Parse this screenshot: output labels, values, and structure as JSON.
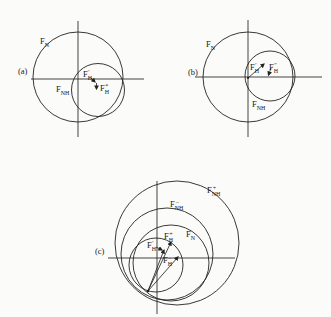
{
  "figure": {
    "background": "#fbfbfa",
    "ink": "#222222",
    "panels": [
      {
        "id": "a",
        "tag": "(a)",
        "tag_pos": {
          "x": 18,
          "y": 74
        },
        "axes": [
          {
            "name": "h-axis",
            "x1": 31,
            "y1": 79,
            "x2": 144,
            "y2": 79
          },
          {
            "name": "v-axis",
            "x1": 78,
            "y1": 21,
            "x2": 78,
            "y2": 137
          }
        ],
        "circles": [
          {
            "name": "circle-FN",
            "cx": 78,
            "cy": 77,
            "r": 45
          },
          {
            "name": "circle-FNH",
            "cx": 98,
            "cy": 90,
            "r": 26.5
          }
        ],
        "labels": [
          {
            "name": "label-FN",
            "t": "F",
            "sub": "N",
            "sup": "",
            "x": 40,
            "y": 44
          },
          {
            "name": "label-FNH",
            "t": "F",
            "sub": "NH",
            "sup": "",
            "x": 56,
            "y": 92
          },
          {
            "name": "label-FH-prime",
            "t": "F",
            "sub": "H",
            "sup": "′",
            "x": 83,
            "y": 77
          },
          {
            "name": "label-FH-star",
            "t": "F",
            "sub": "H",
            "sup": "*",
            "x": 100,
            "y": 91
          }
        ],
        "arrows": [
          {
            "name": "leader-FH-prime",
            "x1": 91,
            "y1": 78,
            "x2": 95,
            "y2": 82
          },
          {
            "name": "arrow-FH-star-down",
            "x1": 96.5,
            "y1": 83,
            "x2": 96.5,
            "y2": 89
          }
        ],
        "dots": []
      },
      {
        "id": "b",
        "tag": "(b)",
        "tag_pos": {
          "x": 188,
          "y": 75
        },
        "axes": [
          {
            "name": "h-axis",
            "x1": 195,
            "y1": 77,
            "x2": 322,
            "y2": 77
          },
          {
            "name": "v-axis",
            "x1": 248,
            "y1": 20,
            "x2": 248,
            "y2": 137
          }
        ],
        "circles": [
          {
            "name": "circle-FN",
            "cx": 248,
            "cy": 77,
            "r": 45
          },
          {
            "name": "circle-FNH",
            "cx": 270,
            "cy": 76,
            "r": 25
          }
        ],
        "labels": [
          {
            "name": "label-FN",
            "t": "F",
            "sub": "N",
            "sup": "",
            "x": 206,
            "y": 47
          },
          {
            "name": "label-FNH",
            "t": "F",
            "sub": "NH",
            "sup": "",
            "x": 252,
            "y": 107
          },
          {
            "name": "label-FH-prime",
            "t": "F",
            "sub": "H",
            "sup": "′",
            "x": 250,
            "y": 70
          },
          {
            "name": "label-FH-dprime",
            "t": "F",
            "sub": "H",
            "sup": "″",
            "x": 269,
            "y": 70
          }
        ],
        "arrows": [
          {
            "name": "vector-FH",
            "x1": 248,
            "y1": 78,
            "x2": 264,
            "y2": 64
          },
          {
            "name": "arrow-FH-dprime-down",
            "x1": 271,
            "y1": 68,
            "x2": 268.5,
            "y2": 75
          }
        ],
        "dots": [
          {
            "x": 248,
            "y": 78,
            "r": 1
          }
        ]
      },
      {
        "id": "c",
        "tag": "(c)",
        "tag_pos": {
          "x": 95,
          "y": 254
        },
        "axes": [
          {
            "name": "h-axis",
            "x1": 108,
            "y1": 258,
            "x2": 235,
            "y2": 258
          },
          {
            "name": "v-axis",
            "x1": 157,
            "y1": 181,
            "x2": 157,
            "y2": 314
          }
        ],
        "circles": [
          {
            "name": "circle-inner",
            "cx": 156,
            "cy": 265,
            "r": 27
          },
          {
            "name": "circle-FN",
            "cx": 171,
            "cy": 263,
            "r": 38
          },
          {
            "name": "circle-FNH-minus",
            "cx": 167,
            "cy": 254,
            "r": 46
          },
          {
            "name": "circle-FNH-plus",
            "cx": 177,
            "cy": 243,
            "r": 62
          }
        ],
        "labels": [
          {
            "name": "label-FNH-plus",
            "t": "F",
            "sub": "NH",
            "sup": "+",
            "x": 207,
            "y": 193
          },
          {
            "name": "label-FNH-minus",
            "t": "F",
            "sub": "NH",
            "sup": "−",
            "x": 170,
            "y": 207
          },
          {
            "name": "label-FN",
            "t": "F",
            "sub": "N",
            "sup": "",
            "x": 186,
            "y": 237
          },
          {
            "name": "label-FH-plus",
            "t": "F",
            "sub": "H",
            "sup": "+",
            "x": 164,
            "y": 239
          },
          {
            "name": "label-FH-prime",
            "t": "F",
            "sub": "H",
            "sup": "′",
            "x": 147,
            "y": 248
          },
          {
            "name": "label-FH-minus",
            "t": "F",
            "sub": "H",
            "sup": "−",
            "x": 163,
            "y": 263
          }
        ],
        "arrows": [
          {
            "name": "vector-FH-prime",
            "x1": 148,
            "y1": 291,
            "x2": 164,
            "y2": 250
          },
          {
            "name": "vector-FH-plus",
            "x1": 148,
            "y1": 291,
            "x2": 171,
            "y2": 242
          },
          {
            "name": "vector-FH-minus",
            "x1": 148,
            "y1": 291,
            "x2": 178,
            "y2": 257
          },
          {
            "name": "leader-FH-prime",
            "x1": 156,
            "y1": 247,
            "x2": 162,
            "y2": 250
          }
        ],
        "dots": [
          {
            "x": 148,
            "y": 291,
            "r": 1.3
          }
        ]
      }
    ]
  }
}
